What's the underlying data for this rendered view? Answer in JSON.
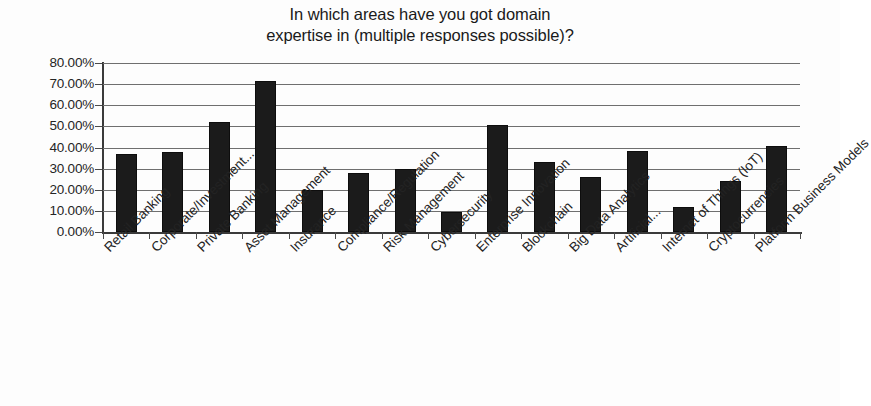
{
  "chart_data": {
    "type": "bar",
    "title": "In which areas have you got domain expertise in (multiple responses possible)?",
    "title_lines": [
      "In which areas have you got domain",
      "expertise in (multiple responses possible)?"
    ],
    "xlabel": "",
    "ylabel": "",
    "ylim": [
      0,
      80
    ],
    "grid": true,
    "legend": false,
    "bar_color": "#1b1b1b",
    "categories": [
      "Retail Banking",
      "Corporate/Investment...",
      "Private Banking",
      "Asset Management",
      "Insurance",
      "Compliance/Regulation",
      "Risk Management",
      "Cybersecurity",
      "Enterprise Innovation",
      "Blockchain",
      "Big Data Analytics",
      "Artificial...",
      "Internet of Things (IoT)",
      "Cryptocurrencies",
      "Platform Business Models"
    ],
    "values": [
      37.0,
      38.0,
      52.0,
      71.5,
      20.0,
      28.0,
      30.0,
      9.5,
      50.5,
      33.0,
      26.0,
      38.5,
      12.0,
      24.0,
      40.5
    ],
    "value_labels": [
      "37.00%",
      "38.00%",
      "52.00%",
      "71.50%",
      "20.00%",
      "28.00%",
      "30.00%",
      "9.50%",
      "50.50%",
      "33.00%",
      "26.00%",
      "38.50%",
      "12.00%",
      "24.00%",
      "40.50%"
    ],
    "y_ticks": [
      0,
      10,
      20,
      30,
      40,
      50,
      60,
      70,
      80
    ],
    "y_tick_labels": [
      "0.00%",
      "10.00%",
      "20.00%",
      "30.00%",
      "40.00%",
      "50.00%",
      "60.00%",
      "70.00%",
      "80.00%"
    ]
  }
}
